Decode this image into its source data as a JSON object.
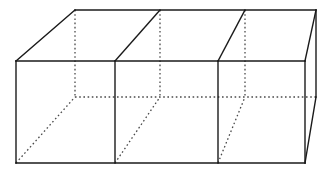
{
  "figure": {
    "title": "Partitioned rectangular prism",
    "type": "geometric-line-drawing",
    "canvas": {
      "width": 332,
      "height": 173,
      "background": "#ffffff"
    },
    "style": {
      "solid_color": "#1a1a1a",
      "hidden_color": "#4a4a4a",
      "solid_width": 1.4,
      "hidden_width": 1.3,
      "hidden_dash": "1.6 2.6"
    },
    "projection": {
      "kind": "oblique",
      "depth_offset_x": 59,
      "depth_offset_y": -51
    },
    "geometry": {
      "front_face": {
        "top_left": {
          "x": 16,
          "y": 61
        },
        "top_right": {
          "x": 305,
          "y": 61
        },
        "bottom_right": {
          "x": 305,
          "y": 163
        },
        "bottom_left": {
          "x": 16,
          "y": 163
        }
      },
      "back_face": {
        "top_left": {
          "x": 75,
          "y": 10
        },
        "top_right": {
          "x": 316,
          "y": 10
        },
        "bottom_right": {
          "x": 316,
          "y": 97
        },
        "bottom_left": {
          "x": 75,
          "y": 97
        }
      },
      "front_dividers_x": [
        115,
        218
      ],
      "back_dividers_x": [
        160,
        245
      ],
      "divider_count": 2,
      "compartment_count": 3
    },
    "edges": {
      "solid": [
        {
          "name": "front-top-edge",
          "x1": 16,
          "y1": 61,
          "x2": 305,
          "y2": 61
        },
        {
          "name": "front-bottom-edge",
          "x1": 16,
          "y1": 163,
          "x2": 305,
          "y2": 163
        },
        {
          "name": "front-left-edge",
          "x1": 16,
          "y1": 61,
          "x2": 16,
          "y2": 163
        },
        {
          "name": "front-right-edge",
          "x1": 305,
          "y1": 61,
          "x2": 305,
          "y2": 163
        },
        {
          "name": "back-top-edge",
          "x1": 75,
          "y1": 10,
          "x2": 316,
          "y2": 10
        },
        {
          "name": "top-left-receding-edge",
          "x1": 16,
          "y1": 61,
          "x2": 75,
          "y2": 10
        },
        {
          "name": "top-right-receding-edge",
          "x1": 305,
          "y1": 61,
          "x2": 316,
          "y2": 10
        },
        {
          "name": "back-right-vertical-edge",
          "x1": 316,
          "y1": 10,
          "x2": 316,
          "y2": 97
        },
        {
          "name": "bottom-right-receding-edge",
          "x1": 305,
          "y1": 163,
          "x2": 316,
          "y2": 97
        },
        {
          "name": "divider-1-front-vertical",
          "x1": 115,
          "y1": 61,
          "x2": 115,
          "y2": 163
        },
        {
          "name": "divider-2-front-vertical",
          "x1": 218,
          "y1": 61,
          "x2": 218,
          "y2": 163
        },
        {
          "name": "divider-1-top-receding",
          "x1": 115,
          "y1": 61,
          "x2": 160,
          "y2": 10
        },
        {
          "name": "divider-2-top-receding",
          "x1": 218,
          "y1": 61,
          "x2": 245,
          "y2": 10
        }
      ],
      "hidden": [
        {
          "name": "back-left-vertical-edge",
          "x1": 75,
          "y1": 10,
          "x2": 75,
          "y2": 97
        },
        {
          "name": "back-bottom-edge",
          "x1": 75,
          "y1": 97,
          "x2": 316,
          "y2": 97
        },
        {
          "name": "bottom-left-receding-edge",
          "x1": 16,
          "y1": 163,
          "x2": 75,
          "y2": 97
        },
        {
          "name": "divider-1-back-vertical",
          "x1": 160,
          "y1": 10,
          "x2": 160,
          "y2": 97
        },
        {
          "name": "divider-2-back-vertical",
          "x1": 245,
          "y1": 10,
          "x2": 245,
          "y2": 97
        },
        {
          "name": "divider-1-bottom-receding",
          "x1": 115,
          "y1": 163,
          "x2": 160,
          "y2": 97
        },
        {
          "name": "divider-2-bottom-receding",
          "x1": 218,
          "y1": 163,
          "x2": 245,
          "y2": 97
        }
      ]
    }
  }
}
